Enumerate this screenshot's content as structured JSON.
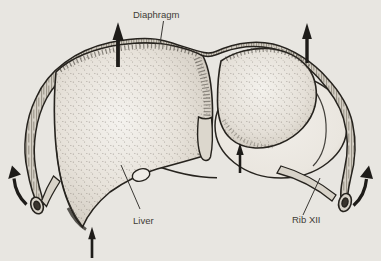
{
  "figure": {
    "background_color": "#e8e6e1",
    "ink_color": "#26231e",
    "labels": {
      "diaphragm": "Diaphragm",
      "liver": "Liver",
      "rib_xii": "Rib XII"
    },
    "annotations": {
      "up_arrow_count": 4,
      "curved_arrow_count": 2
    }
  }
}
